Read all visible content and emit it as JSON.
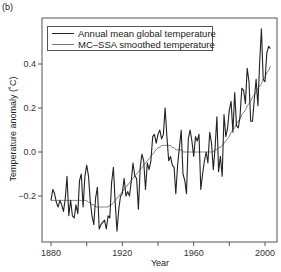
{
  "panel_label": "(b)",
  "legend": {
    "annual_label": "Annual mean global temperature",
    "smooth_label": "MC–SSA smoothed temperature"
  },
  "axes": {
    "xlabel": "Year",
    "ylabel": "Temperature anomaly (˚C)"
  },
  "colors": {
    "annual": "#222222",
    "smooth": "#808080",
    "axis": "#555555"
  },
  "chart_data": {
    "type": "line",
    "title": "",
    "xlabel": "Year",
    "ylabel": "Temperature anomaly (˚C)",
    "xlim": [
      1876,
      2007
    ],
    "ylim": [
      -0.42,
      0.62
    ],
    "xticks": [
      1880,
      1900,
      1920,
      1940,
      1960,
      1980,
      2000
    ],
    "xtick_labels": [
      "1880",
      "",
      "1920",
      "",
      "1960",
      "",
      "2000"
    ],
    "yticks": [
      -0.2,
      0.0,
      0.2,
      0.4
    ],
    "ytick_labels": [
      "−0.2",
      "0.0",
      "0.2",
      "0.4"
    ],
    "grid": false,
    "legend_position": "upper left",
    "x": [
      1880,
      1881,
      1882,
      1883,
      1884,
      1885,
      1886,
      1887,
      1888,
      1889,
      1890,
      1891,
      1892,
      1893,
      1894,
      1895,
      1896,
      1897,
      1898,
      1899,
      1900,
      1901,
      1902,
      1903,
      1904,
      1905,
      1906,
      1907,
      1908,
      1909,
      1910,
      1911,
      1912,
      1913,
      1914,
      1915,
      1916,
      1917,
      1918,
      1919,
      1920,
      1921,
      1922,
      1923,
      1924,
      1925,
      1926,
      1927,
      1928,
      1929,
      1930,
      1931,
      1932,
      1933,
      1934,
      1935,
      1936,
      1937,
      1938,
      1939,
      1940,
      1941,
      1942,
      1943,
      1944,
      1945,
      1946,
      1947,
      1948,
      1949,
      1950,
      1951,
      1952,
      1953,
      1954,
      1955,
      1956,
      1957,
      1958,
      1959,
      1960,
      1961,
      1962,
      1963,
      1964,
      1965,
      1966,
      1967,
      1968,
      1969,
      1970,
      1971,
      1972,
      1973,
      1974,
      1975,
      1976,
      1977,
      1978,
      1979,
      1980,
      1981,
      1982,
      1983,
      1984,
      1985,
      1986,
      1987,
      1988,
      1989,
      1990,
      1991,
      1992,
      1993,
      1994,
      1995,
      1996,
      1997,
      1998,
      1999,
      2000,
      2001,
      2002,
      2003
    ],
    "series": [
      {
        "name": "Annual mean global temperature",
        "values": [
          -0.22,
          -0.17,
          -0.19,
          -0.23,
          -0.25,
          -0.22,
          -0.24,
          -0.27,
          -0.21,
          -0.11,
          -0.29,
          -0.22,
          -0.29,
          -0.3,
          -0.24,
          -0.28,
          -0.13,
          -0.1,
          -0.25,
          -0.11,
          -0.06,
          -0.11,
          -0.22,
          -0.29,
          -0.33,
          -0.21,
          -0.16,
          -0.35,
          -0.33,
          -0.32,
          -0.31,
          -0.35,
          -0.29,
          -0.3,
          -0.14,
          -0.07,
          -0.23,
          -0.36,
          -0.26,
          -0.2,
          -0.19,
          -0.12,
          -0.2,
          -0.18,
          -0.2,
          -0.13,
          -0.05,
          -0.11,
          -0.12,
          -0.26,
          -0.07,
          -0.01,
          -0.04,
          -0.17,
          -0.05,
          -0.08,
          -0.04,
          0.07,
          0.08,
          0.04,
          0.08,
          0.1,
          0.06,
          0.08,
          0.2,
          0.07,
          -0.04,
          -0.02,
          -0.06,
          -0.07,
          -0.19,
          -0.06,
          0.02,
          0.1,
          -0.1,
          -0.13,
          -0.19,
          0.06,
          0.1,
          0.05,
          -0.02,
          0.07,
          0.05,
          0.08,
          -0.17,
          -0.1,
          -0.04,
          0.0,
          -0.05,
          0.09,
          0.04,
          -0.08,
          0.02,
          0.16,
          -0.09,
          -0.02,
          -0.11,
          0.17,
          0.07,
          0.11,
          0.19,
          0.23,
          0.09,
          0.27,
          0.12,
          0.11,
          0.16,
          0.29,
          0.28,
          0.22,
          0.38,
          0.32,
          0.14,
          0.14,
          0.24,
          0.33,
          0.21,
          0.4,
          0.56,
          0.33,
          0.32,
          0.45,
          0.48,
          0.47
        ]
      },
      {
        "name": "MC–SSA smoothed temperature",
        "values": [
          -0.22,
          -0.22,
          -0.22,
          -0.22,
          -0.22,
          -0.22,
          -0.22,
          -0.22,
          -0.22,
          -0.22,
          -0.22,
          -0.22,
          -0.22,
          -0.22,
          -0.22,
          -0.22,
          -0.22,
          -0.22,
          -0.22,
          -0.22,
          -0.22,
          -0.23,
          -0.23,
          -0.24,
          -0.24,
          -0.25,
          -0.25,
          -0.25,
          -0.25,
          -0.25,
          -0.25,
          -0.25,
          -0.25,
          -0.24,
          -0.24,
          -0.23,
          -0.22,
          -0.21,
          -0.2,
          -0.19,
          -0.18,
          -0.17,
          -0.16,
          -0.15,
          -0.14,
          -0.13,
          -0.12,
          -0.11,
          -0.1,
          -0.09,
          -0.08,
          -0.07,
          -0.06,
          -0.05,
          -0.04,
          -0.03,
          -0.02,
          -0.01,
          0.0,
          0.01,
          0.02,
          0.02,
          0.03,
          0.03,
          0.03,
          0.03,
          0.03,
          0.03,
          0.02,
          0.02,
          0.01,
          0.01,
          0.01,
          0.01,
          0.0,
          0.0,
          0.0,
          0.0,
          0.0,
          0.0,
          0.0,
          0.0,
          0.0,
          0.0,
          0.0,
          0.0,
          0.0,
          0.0,
          0.0,
          0.0,
          0.0,
          0.0,
          0.01,
          0.01,
          0.02,
          0.02,
          0.03,
          0.04,
          0.05,
          0.06,
          0.07,
          0.09,
          0.1,
          0.11,
          0.13,
          0.14,
          0.15,
          0.17,
          0.18,
          0.19,
          0.21,
          0.22,
          0.23,
          0.25,
          0.26,
          0.27,
          0.29,
          0.3,
          0.31,
          0.33,
          0.34,
          0.36,
          0.37,
          0.39
        ]
      }
    ]
  }
}
